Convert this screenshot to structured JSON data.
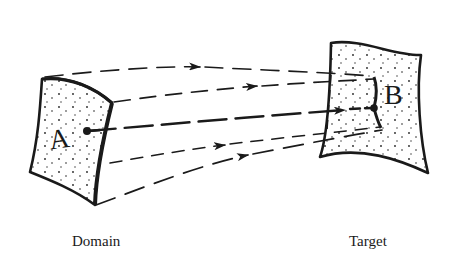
{
  "figure": {
    "domain": {
      "label": "A",
      "caption": "Domain"
    },
    "target": {
      "label": "B",
      "caption": "Target"
    },
    "arrows": [
      {
        "name": "top-edge-line",
        "has_arrowhead": true
      },
      {
        "name": "upper-line",
        "has_arrowhead": true
      },
      {
        "name": "center-line",
        "has_arrowhead": true,
        "from_point": "A",
        "to_point": "B"
      },
      {
        "name": "lower-line",
        "has_arrowhead": true
      },
      {
        "name": "bottom-edge-line",
        "has_arrowhead": true
      }
    ],
    "colors": {
      "ink": "#1a1a1a",
      "background": "#ffffff"
    }
  }
}
